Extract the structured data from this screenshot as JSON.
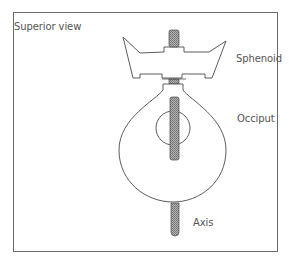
{
  "figure": {
    "view_label": "Superior view",
    "labels": {
      "sphenoid": "Sphenoid",
      "occiput": "Occiput",
      "axis": "Axis"
    }
  },
  "colors": {
    "outline": "#4a4a4a",
    "rod_fill": "#9a9a9a",
    "frame": "#6a6a6a",
    "text": "#555555"
  }
}
